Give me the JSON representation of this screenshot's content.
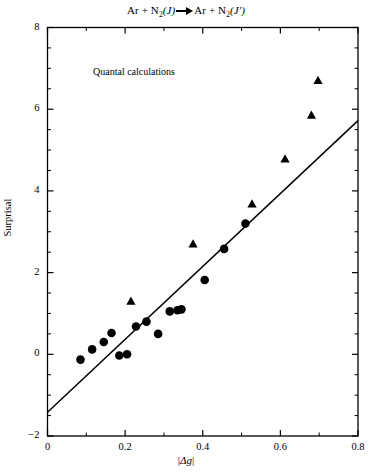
{
  "figure": {
    "title_parts": {
      "reactant": "Ar + N",
      "reactant_sub": "2",
      "reactant_state": "(J)",
      "product": "Ar + N",
      "product_sub": "2",
      "product_state": "(J')"
    },
    "title_plain": "Ar + N2(J) → Ar + N2(J')",
    "annotation": "Quantal calculations",
    "axis_color": "#000000",
    "marker_color": "#000000",
    "line_color": "#000000"
  },
  "chart_data": {
    "type": "scatter",
    "xlabel": "|Δg|",
    "ylabel": "Surprisal",
    "xlim": [
      0,
      0.8
    ],
    "ylim": [
      -2,
      8
    ],
    "xticks": [
      0,
      0.2,
      0.4,
      0.6,
      0.8
    ],
    "xtick_labels": [
      "0",
      "0.2",
      "0.4",
      "0.6",
      "0.8"
    ],
    "yticks": [
      -2,
      0,
      2,
      4,
      6,
      8
    ],
    "ytick_labels": [
      "-2",
      "0",
      "2",
      "4",
      "6",
      "8"
    ],
    "x_minor_ticks": [
      0.1,
      0.3,
      0.5,
      0.7
    ],
    "y_minor_ticks": [
      -1.5,
      -1,
      -0.5,
      0.5,
      1,
      1.5,
      2.5,
      3,
      3.5,
      4.5,
      5,
      5.5,
      6.5,
      7,
      7.5
    ],
    "grid": false,
    "legend": null,
    "annotations": [
      {
        "text": "Quantal calculations",
        "x": 0.12,
        "y": 6.6
      }
    ],
    "series": [
      {
        "name": "circles",
        "marker": "circle",
        "points": [
          {
            "x": 0.085,
            "y": -0.13
          },
          {
            "x": 0.115,
            "y": 0.12
          },
          {
            "x": 0.145,
            "y": 0.3
          },
          {
            "x": 0.165,
            "y": 0.52
          },
          {
            "x": 0.185,
            "y": -0.03
          },
          {
            "x": 0.205,
            "y": 0.0
          },
          {
            "x": 0.228,
            "y": 0.68
          },
          {
            "x": 0.255,
            "y": 0.8
          },
          {
            "x": 0.285,
            "y": 0.5
          },
          {
            "x": 0.315,
            "y": 1.05
          },
          {
            "x": 0.335,
            "y": 1.08
          },
          {
            "x": 0.345,
            "y": 1.1
          },
          {
            "x": 0.405,
            "y": 1.82
          },
          {
            "x": 0.455,
            "y": 2.58
          },
          {
            "x": 0.51,
            "y": 3.2
          }
        ]
      },
      {
        "name": "triangles",
        "marker": "triangle",
        "points": [
          {
            "x": 0.215,
            "y": 1.3
          },
          {
            "x": 0.375,
            "y": 2.7
          },
          {
            "x": 0.527,
            "y": 3.68
          },
          {
            "x": 0.612,
            "y": 4.78
          },
          {
            "x": 0.68,
            "y": 5.85
          },
          {
            "x": 0.697,
            "y": 6.7
          }
        ]
      }
    ],
    "fit_line": {
      "name": "linear-fit",
      "x_start": 0.0,
      "y_start": -1.42,
      "x_end": 0.8,
      "y_end": 5.72,
      "slope": 8.93,
      "intercept": -1.42
    }
  }
}
